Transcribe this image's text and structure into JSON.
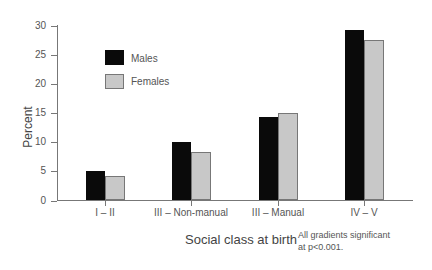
{
  "chart_data": {
    "type": "bar",
    "title": "",
    "xlabel": "Social class at birth",
    "ylabel": "Percent",
    "ylim": [
      0,
      30
    ],
    "yticks": [
      0,
      5,
      10,
      15,
      20,
      25,
      30
    ],
    "grid": false,
    "legend_position": "upper-left-inside",
    "categories": [
      "I – II",
      "III – Non-manual",
      "III – Manual",
      "IV – V"
    ],
    "series": [
      {
        "name": "Males",
        "color": "#0a0a0a",
        "values": [
          5.0,
          10.0,
          14.3,
          29.3
        ]
      },
      {
        "name": "Females",
        "color": "#c8c8c8",
        "values": [
          4.2,
          8.4,
          15.0,
          27.6
        ]
      }
    ],
    "annotation": "All gradients significant at p<0.001."
  },
  "legend": {
    "males": "Males",
    "females": "Females"
  },
  "axis": {
    "ylabel": "Percent",
    "xlabel": "Social class at birth",
    "yticks": [
      "0",
      "5",
      "10",
      "15",
      "20",
      "25",
      "30"
    ]
  },
  "categories": [
    "I – II",
    "III – Non-manual",
    "III – Manual",
    "IV – V"
  ],
  "note": {
    "line1": "All gradients significant",
    "line2": "at p<0.001."
  }
}
